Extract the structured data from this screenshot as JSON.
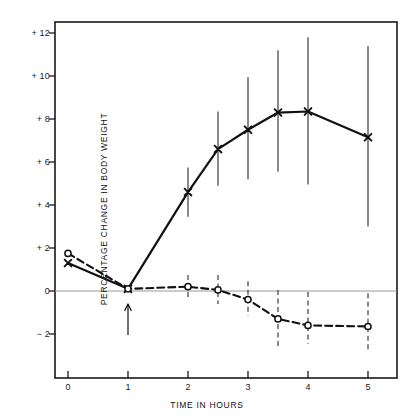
{
  "chart_data": {
    "type": "line",
    "title": "",
    "xlabel": "TIME IN HOURS",
    "ylabel": "PERCENTAGE CHANGE IN BODY WEIGHT",
    "xlim": [
      -0.25,
      5.45
    ],
    "ylim": [
      -3.2,
      13.2
    ],
    "xticks": [
      0,
      1,
      2,
      3,
      4,
      5
    ],
    "xtick_labels": [
      "0",
      "1",
      "2",
      "3",
      "4",
      "5"
    ],
    "yticks": [
      -2,
      0,
      2,
      4,
      6,
      8,
      10,
      12
    ],
    "ytick_labels": [
      "− 2",
      "0",
      "+ 2",
      "+ 4",
      "+ 6",
      "+ 8",
      "+ 10",
      "+ 12"
    ],
    "grid": false,
    "zero_line": true,
    "legend": "none",
    "annotations": [
      {
        "name": "dose-arrow",
        "x": 1,
        "label": "",
        "type": "up-arrow-below-axis"
      }
    ],
    "series": [
      {
        "name": "treated",
        "marker": "x",
        "line_style": "solid",
        "x": [
          0,
          1,
          2,
          2.5,
          3,
          3.5,
          4,
          5
        ],
        "values": [
          1.3,
          0.1,
          4.6,
          6.6,
          7.5,
          8.3,
          8.35,
          7.15
        ],
        "err_low": [
          null,
          null,
          3.45,
          4.9,
          5.2,
          5.55,
          4.95,
          3.0
        ],
        "err_high": [
          null,
          null,
          5.75,
          8.35,
          9.95,
          11.2,
          11.8,
          11.4
        ]
      },
      {
        "name": "control",
        "marker": "o",
        "line_style": "dashed",
        "x": [
          0,
          1,
          2,
          2.5,
          3,
          3.5,
          4,
          5
        ],
        "values": [
          1.75,
          0.1,
          0.2,
          0.05,
          -0.4,
          -1.3,
          -1.6,
          -1.65
        ],
        "err_low": [
          null,
          null,
          -0.3,
          -0.6,
          -1.15,
          -2.65,
          -2.45,
          -2.85
        ],
        "err_high": [
          null,
          null,
          0.75,
          0.75,
          0.45,
          0.05,
          -0.05,
          -0.1
        ]
      }
    ]
  },
  "axes": {
    "x_title": "TIME IN HOURS",
    "y_title": "PERCENTAGE CHANGE IN BODY WEIGHT"
  },
  "colors": {
    "ink": "#111111",
    "axis": "#1a1a1a",
    "zero_line": "#9a9a9a",
    "error_bar": "#2a2a2a",
    "background": "#ffffff"
  }
}
